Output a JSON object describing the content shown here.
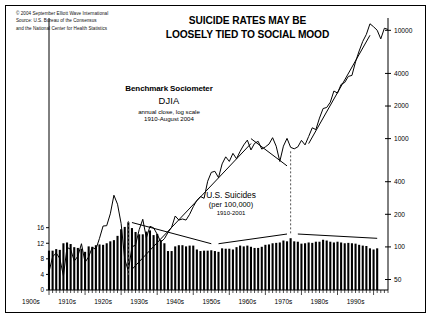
{
  "credit": {
    "line1": "© 2004 September Elliott Wave International",
    "line2": "Source: U.S. Bureau of the Consensus",
    "line3": "and the National Center for Health Statistics"
  },
  "title": {
    "line1": "SUICIDE RATES MAY BE",
    "line2": "LOOSELY TIED TO SOCIAL MOOD"
  },
  "annotation_djia": {
    "line1": "Benchmark Sociometer",
    "line2": "DJIA",
    "line3": "annual close, log scale",
    "line4": "1910-August 2004"
  },
  "annotation_suicides": {
    "line1": "U.S. Suicides",
    "line2": "(per 100,000)",
    "line3": "1910-2001"
  },
  "chart_data": {
    "type": "line",
    "title": "SUICIDE RATES MAY BE LOOSELY TIED TO SOCIAL MOOD",
    "xlabel": "",
    "ylabel": "",
    "grid": false,
    "legend": "none",
    "x_ticks": [
      "1900s",
      "1910s",
      "1920s",
      "1930s",
      "1940s",
      "1950s",
      "1960s",
      "1970s",
      "1980s",
      "1990s"
    ],
    "x_range": [
      1910,
      2004
    ],
    "left_axis": {
      "label": "U.S. Suicides (per 100,000)",
      "ticks": [
        0,
        4,
        8,
        12,
        16
      ],
      "range": [
        0,
        19
      ],
      "scale": "linear"
    },
    "right_axis": {
      "label": "DJIA annual close",
      "ticks": [
        50,
        100,
        200,
        400,
        1000,
        2000,
        4000,
        10000
      ],
      "range": [
        40,
        13000
      ],
      "scale": "log"
    },
    "series": [
      {
        "name": "DJIA annual close, log scale",
        "type": "line",
        "axis": "right",
        "x": [
          1910,
          1911,
          1912,
          1913,
          1914,
          1915,
          1916,
          1917,
          1918,
          1919,
          1920,
          1921,
          1922,
          1923,
          1924,
          1925,
          1926,
          1927,
          1928,
          1929,
          1930,
          1931,
          1932,
          1933,
          1934,
          1935,
          1936,
          1937,
          1938,
          1939,
          1940,
          1941,
          1942,
          1943,
          1944,
          1945,
          1946,
          1947,
          1948,
          1949,
          1950,
          1951,
          1952,
          1953,
          1954,
          1955,
          1956,
          1957,
          1958,
          1959,
          1960,
          1961,
          1962,
          1963,
          1964,
          1965,
          1966,
          1967,
          1968,
          1969,
          1970,
          1971,
          1972,
          1973,
          1974,
          1975,
          1976,
          1977,
          1978,
          1979,
          1980,
          1981,
          1982,
          1983,
          1984,
          1985,
          1986,
          1987,
          1988,
          1989,
          1990,
          1991,
          1992,
          1993,
          1994,
          1995,
          1996,
          1997,
          1998,
          1999,
          2000,
          2001,
          2002,
          2003,
          2004
        ],
        "values": [
          59,
          81,
          88,
          78,
          54,
          99,
          95,
          74,
          82,
          107,
          72,
          81,
          99,
          95,
          120,
          156,
          157,
          202,
          300,
          248,
          164,
          77,
          60,
          100,
          104,
          144,
          180,
          121,
          155,
          150,
          131,
          111,
          119,
          136,
          152,
          193,
          177,
          181,
          177,
          200,
          235,
          269,
          292,
          281,
          404,
          488,
          499,
          436,
          584,
          679,
          616,
          731,
          652,
          763,
          874,
          969,
          786,
          905,
          944,
          800,
          839,
          890,
          1020,
          851,
          616,
          852,
          1005,
          831,
          805,
          839,
          964,
          875,
          1047,
          1259,
          1212,
          1547,
          1896,
          1939,
          2169,
          2753,
          2634,
          3169,
          3301,
          3754,
          3834,
          5117,
          6448,
          7908,
          9181,
          11497,
          10787,
          10021,
          8342,
          10454,
          10200
        ]
      },
      {
        "name": "U.S. Suicides per 100,000",
        "type": "bar",
        "axis": "left",
        "x": [
          1910,
          1911,
          1912,
          1913,
          1914,
          1915,
          1916,
          1917,
          1918,
          1919,
          1920,
          1921,
          1922,
          1923,
          1924,
          1925,
          1926,
          1927,
          1928,
          1929,
          1930,
          1931,
          1932,
          1933,
          1934,
          1935,
          1936,
          1937,
          1938,
          1939,
          1940,
          1941,
          1942,
          1943,
          1944,
          1945,
          1946,
          1947,
          1948,
          1949,
          1950,
          1951,
          1952,
          1953,
          1954,
          1955,
          1956,
          1957,
          1958,
          1959,
          1960,
          1961,
          1962,
          1963,
          1964,
          1965,
          1966,
          1967,
          1968,
          1969,
          1970,
          1971,
          1972,
          1973,
          1974,
          1975,
          1976,
          1977,
          1978,
          1979,
          1980,
          1981,
          1982,
          1983,
          1984,
          1985,
          1986,
          1987,
          1988,
          1989,
          1990,
          1991,
          1992,
          1993,
          1994,
          1995,
          1996,
          1997,
          1998,
          1999,
          2000,
          2001
        ],
        "values": [
          10.1,
          10.1,
          10.5,
          10.3,
          12.0,
          12.2,
          11.8,
          11.0,
          10.8,
          10.6,
          9.8,
          11.2,
          11.1,
          11.5,
          11.7,
          11.6,
          12.0,
          12.5,
          12.8,
          13.9,
          15.6,
          16.2,
          17.4,
          15.9,
          14.9,
          14.3,
          14.3,
          15.0,
          15.3,
          14.1,
          14.4,
          12.8,
          12.0,
          10.0,
          10.0,
          11.2,
          11.5,
          11.5,
          11.2,
          11.4,
          11.4,
          10.4,
          10.0,
          10.1,
          10.1,
          10.2,
          10.0,
          9.8,
          10.7,
          10.6,
          10.6,
          10.4,
          11.0,
          11.4,
          11.2,
          11.4,
          11.1,
          10.8,
          10.8,
          11.1,
          11.6,
          11.7,
          12.0,
          12.1,
          12.2,
          12.7,
          12.5,
          13.3,
          12.5,
          12.4,
          11.9,
          12.0,
          12.2,
          12.1,
          12.4,
          12.4,
          12.9,
          12.7,
          12.4,
          12.2,
          12.4,
          12.2,
          12.0,
          12.1,
          12.0,
          11.9,
          11.6,
          11.4,
          11.3,
          10.7,
          10.4,
          10.7
        ]
      }
    ],
    "annotations": [
      {
        "name": "djia-label",
        "text": "Benchmark Sociometer DJIA annual close, log scale 1910-August 2004"
      },
      {
        "name": "suicides-label",
        "text": "U.S. Suicides (per 100,000) 1910-2001"
      },
      {
        "name": "dashed-line-1932",
        "text": "",
        "x": 1932
      },
      {
        "name": "dashed-line-1977",
        "text": "",
        "x": 1977
      },
      {
        "name": "trendline-djia-1932-1966",
        "text": ""
      },
      {
        "name": "trendline-djia-1982-2000",
        "text": ""
      },
      {
        "name": "trendline-suicide-down-1932-1955",
        "text": ""
      },
      {
        "name": "trendline-suicide-up-1957-1977",
        "text": ""
      },
      {
        "name": "trendline-suicide-down-1977-2001",
        "text": ""
      },
      {
        "name": "trendline-djia-1966-1977-down",
        "text": ""
      }
    ]
  }
}
